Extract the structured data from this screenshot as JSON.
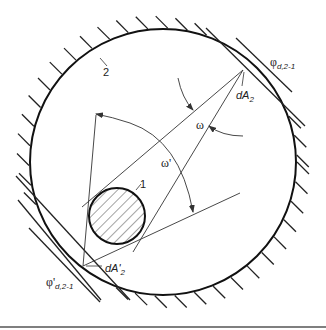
{
  "diagram": {
    "labels": {
      "surface_1": "1",
      "surface_2": "2",
      "dA2": "dA",
      "dA2_sub": "2",
      "dA2_prime": "dA'",
      "dA2_prime_sub": "2",
      "omega": "ω",
      "omega_prime": "ω'",
      "phi": "φ",
      "phi_sub": "d,2-1",
      "phi_prime": "φ'",
      "phi_prime_sub": "d,2-1"
    },
    "colors": {
      "stroke": "#222222",
      "background": "#ffffff",
      "bottom_rule": "#555555"
    }
  }
}
